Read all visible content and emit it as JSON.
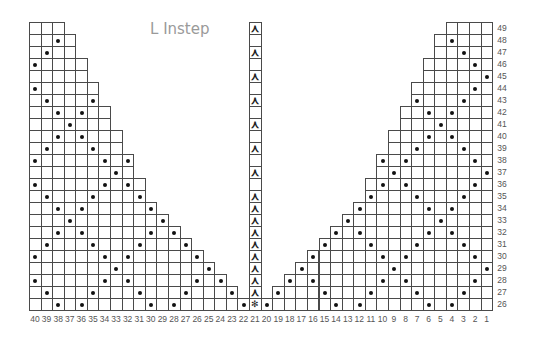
{
  "title": "L Instep",
  "colors": {
    "grid": "#4a4a4a",
    "dot": "#111111",
    "title": "#9a9a9a",
    "label": "#555555"
  },
  "grid": {
    "columns": 40,
    "rows_from": 26,
    "rows_to": 49,
    "col_numbering": "right-to-left (40 at left, 1 at right)"
  },
  "column_labels": [
    "40",
    "39",
    "38",
    "37",
    "36",
    "35",
    "34",
    "33",
    "32",
    "31",
    "30",
    "29",
    "28",
    "27",
    "26",
    "25",
    "24",
    "23",
    "22",
    "21",
    "20",
    "19",
    "18",
    "17",
    "16",
    "15",
    "14",
    "13",
    "12",
    "11",
    "10",
    "9",
    "8",
    "7",
    "6",
    "5",
    "4",
    "3",
    "2",
    "1"
  ],
  "row_labels": [
    "49",
    "48",
    "47",
    "46",
    "45",
    "44",
    "43",
    "42",
    "41",
    "40",
    "39",
    "38",
    "37",
    "36",
    "35",
    "34",
    "33",
    "32",
    "31",
    "30",
    "29",
    "28",
    "27",
    "26"
  ],
  "legend_symbols": {
    "dot": "purl / pattern stitch (dot)",
    "arrow": "ᚼ-style decrease arrow",
    "star": "center star stitch"
  },
  "left_section": {
    "row_extent_cols_from_40": {
      "49": 3,
      "48": 4,
      "47": 4,
      "46": 5,
      "45": 5,
      "44": 6,
      "43": 6,
      "42": 7,
      "41": 7,
      "40": 8,
      "39": 8,
      "38": 9,
      "37": 9,
      "36": 10,
      "35": 10,
      "34": 11,
      "33": 12,
      "32": 13,
      "31": 14,
      "30": 15,
      "29": 16,
      "28": 17,
      "27": 18,
      "26": 19
    },
    "dot_rule": "dot where (col - 33) mod 8 == ±d, d = min(v, 8-v), v = (row-29) mod 8"
  },
  "center_column": {
    "col": 21,
    "arrow_rows": [
      49,
      47,
      45,
      43,
      41,
      39,
      37,
      35,
      34,
      33,
      32,
      31,
      30,
      29,
      28,
      27
    ],
    "star_row": 26,
    "empty_rows": [
      48,
      46,
      44,
      42,
      40,
      38,
      36
    ]
  },
  "right_section": {
    "row_extent_cols_from_1": {
      "49": 4,
      "48": 5,
      "47": 5,
      "46": 6,
      "45": 6,
      "44": 7,
      "43": 7,
      "42": 8,
      "41": 8,
      "40": 9,
      "39": 9,
      "38": 10,
      "37": 10,
      "36": 11,
      "35": 11,
      "34": 12,
      "33": 13,
      "32": 14,
      "31": 15,
      "30": 16,
      "29": 17,
      "28": 18,
      "27": 19,
      "26": 20
    },
    "dot_rule": "dot where (col - 1) mod 8 == ±d, d = min(v, 8-v), v = (row-29) mod 8"
  }
}
